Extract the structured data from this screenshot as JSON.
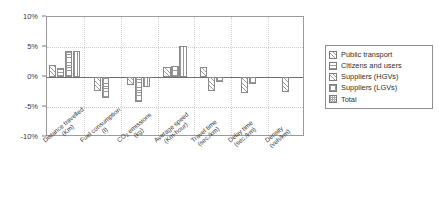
{
  "chart_data": {
    "type": "bar",
    "title": "",
    "xlabel": "",
    "ylabel": "",
    "ylim": [
      -10,
      10
    ],
    "ytick_labels": [
      "10%",
      "5%",
      "0%",
      "-5%",
      "-10%"
    ],
    "ytick_values": [
      10,
      5,
      0,
      -5,
      -10
    ],
    "grid": true,
    "legend_position": "right",
    "categories": [
      "Distance travelled (Km)",
      "Fuel consumption (l)",
      "CO2 emissions (kg)",
      "Average speed (Km-hour)",
      "Travel time (sec./km)",
      "Delay time (sec./km)",
      "Density (veh/km)"
    ],
    "category_parts": [
      {
        "name": "Distance travelled",
        "unit": "(Km)"
      },
      {
        "name": "Fuel consumption",
        "unit": "(l)"
      },
      {
        "name": "CO",
        "name_sub": "2",
        "name_tail": " emissions",
        "unit": "(kg)"
      },
      {
        "name": "Average speed",
        "unit": "(Km-hour)"
      },
      {
        "name": "Travel time",
        "unit": "(sec./km)"
      },
      {
        "name": "Delay time",
        "unit": "(sec./km)"
      },
      {
        "name": "Density",
        "unit": "(veh/km)"
      }
    ],
    "series": [
      {
        "name": "Public transport",
        "pattern": "pat-diag",
        "values": [
          2.0,
          null,
          null,
          1.6,
          1.7,
          null,
          null
        ]
      },
      {
        "name": "Citizens and users",
        "pattern": "pat-horiz",
        "values": [
          1.5,
          null,
          null,
          null,
          null,
          null,
          null
        ]
      },
      {
        "name": "Suppliers (HGVs)",
        "pattern": "pat-diag",
        "values": [
          null,
          -2.3,
          -1.4,
          null,
          -2.4,
          -2.6,
          -2.5
        ]
      },
      {
        "name": "Suppliers (LGVs)",
        "pattern": "pat-grid",
        "values": [
          4.4,
          -3.5,
          -4.2,
          1.9,
          -0.8,
          -1.2,
          null
        ]
      },
      {
        "name": "Total",
        "pattern": "pat-vert",
        "values": [
          4.3,
          null,
          -1.7,
          5.2,
          null,
          null,
          null
        ]
      }
    ]
  },
  "legend": {
    "items": [
      {
        "label": "Public transport",
        "swatch": "pat-diag"
      },
      {
        "label": "Citizens and users",
        "swatch": "pat-horiz"
      },
      {
        "label": "Suppliers (HGVs)",
        "swatch": "pat-diag"
      },
      {
        "label": "Suppliers (LGVs)",
        "swatch": "pat-grid"
      },
      {
        "label": "Total",
        "swatch": "pat-dots"
      }
    ]
  },
  "colors": {
    "axis": "#9a9a9a",
    "zero_line": "#6f6f6f",
    "grid": "#c9c9c9",
    "bar_stroke": "#8a8a8a",
    "bar_fill": "#ffffff",
    "text": "#3a3a3a",
    "background": "#ffffff"
  }
}
